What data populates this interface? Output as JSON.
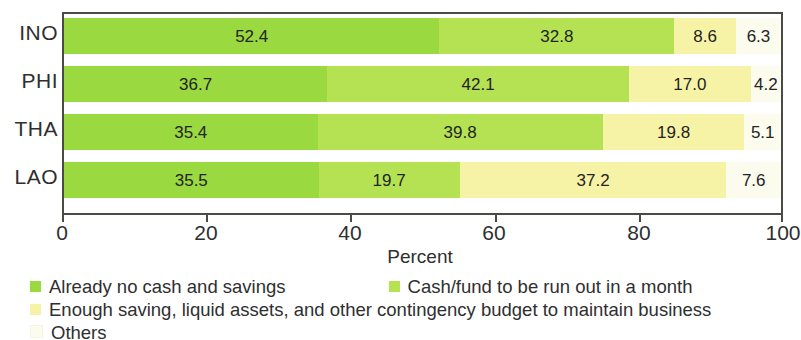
{
  "chart_data": {
    "type": "bar",
    "orientation": "horizontal",
    "stacked": true,
    "normalized_percent": true,
    "title": "",
    "subtitle": "",
    "xlabel": "Percent",
    "ylabel": "",
    "xlim": [
      0,
      100
    ],
    "xticks": [
      0,
      20,
      40,
      60,
      80,
      100
    ],
    "xtick_labels": [
      "0",
      "20",
      "40",
      "60",
      "80",
      "100"
    ],
    "grid": false,
    "legend_position": "bottom-left",
    "categories": [
      "INO",
      "PHI",
      "THA",
      "LAO"
    ],
    "series": [
      {
        "name": "Already no cash and savings",
        "color": "#9ad93f",
        "values": [
          52.4,
          36.7,
          35.4,
          35.5
        ],
        "labels": [
          "52.4",
          "36.7",
          "35.4",
          "35.5"
        ]
      },
      {
        "name": "Cash/fund to be run out in a month",
        "color": "#b5e253",
        "values": [
          32.8,
          42.1,
          39.8,
          19.7
        ],
        "labels": [
          "32.8",
          "42.1",
          "39.8",
          "19.7"
        ]
      },
      {
        "name": "Enough saving, liquid assets, and other contingency budget to maintain business",
        "color": "#f7f3a6",
        "values": [
          8.6,
          17.0,
          19.8,
          37.2
        ],
        "labels": [
          "8.6",
          "17.0",
          "19.8",
          "37.2"
        ]
      },
      {
        "name": "Others",
        "color": "#fbfbee",
        "values": [
          6.3,
          4.2,
          5.1,
          7.6
        ],
        "labels": [
          "6.3",
          "4.2",
          "5.1",
          "7.6"
        ]
      }
    ]
  },
  "axis": {
    "x_title": "Percent",
    "ticks": [
      "0",
      "20",
      "40",
      "60",
      "80",
      "100"
    ],
    "category_labels": [
      "INO",
      "PHI",
      "THA",
      "LAO"
    ]
  },
  "legend": {
    "line1": [
      {
        "label": "Already no cash and savings",
        "color": "#9ad93f"
      },
      {
        "label": "Cash/fund to be run out in a month",
        "color": "#b5e253"
      }
    ],
    "line2": [
      {
        "label": "Enough saving, liquid assets, and other contingency budget to maintain business",
        "color": "#f7f3a6"
      }
    ],
    "line3": [
      {
        "label": "Others",
        "color": "#fbfbee"
      }
    ]
  },
  "bar_values": {
    "INO": [
      "52.4",
      "32.8",
      "8.6",
      "6.3"
    ],
    "PHI": [
      "36.7",
      "42.1",
      "17.0",
      "4.2"
    ],
    "THA": [
      "35.4",
      "39.8",
      "19.8",
      "5.1"
    ],
    "LAO": [
      "35.5",
      "19.7",
      "37.2",
      "7.6"
    ]
  }
}
